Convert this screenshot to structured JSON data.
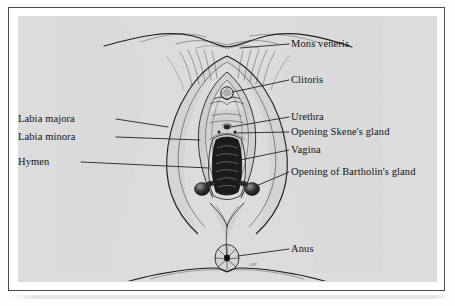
{
  "figure": {
    "type": "anatomical-illustration",
    "style": "pen-and-ink engraving / cross-hatched line drawing",
    "signature": "ART"
  },
  "colors": {
    "plate_background": "#dcdcdc",
    "page_background": "#fefefe",
    "frame_border": "#4a4a4a",
    "ink": "#1a1a1a",
    "label_text": "#111111",
    "leader_line": "#2a2a2a"
  },
  "labels_right": [
    {
      "id": "mons-veneris",
      "text": "Mons veneris"
    },
    {
      "id": "clitoris",
      "text": "Clitoris"
    },
    {
      "id": "urethra",
      "text": "Urethra"
    },
    {
      "id": "opening-skenes-gland",
      "text": "Opening Skene's gland"
    },
    {
      "id": "vagina",
      "text": "Vagina"
    },
    {
      "id": "opening-bartholins-gland",
      "text": "Opening of Bartholin's gland"
    },
    {
      "id": "anus",
      "text": "Anus"
    }
  ],
  "labels_left": [
    {
      "id": "labia-majora",
      "text": "Labia majora"
    },
    {
      "id": "labia-minora",
      "text": "Labia minora"
    },
    {
      "id": "hymen",
      "text": "Hymen"
    }
  ]
}
